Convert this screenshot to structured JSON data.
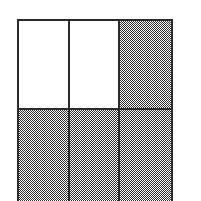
{
  "figure": {
    "kind": "fraction-area-model",
    "columns": 3,
    "rows": 2,
    "total_cells": 6,
    "shaded_cells": 4,
    "unshaded_cells": 2,
    "fraction": "4/6",
    "numerator": "4",
    "denominator": "6",
    "shading_style": "checkerboard-halftone",
    "colors": {
      "outline": "#2b2b2b",
      "divider": "#2b2b2b",
      "shaded_fill": "#808080",
      "shaded_dither_ink": "#2e2e2e",
      "unshaded_fill": "#ffffff",
      "page_background": "#ffffff"
    },
    "cells": [
      {
        "id": "r1c1",
        "row": "1",
        "column": "1",
        "state": "unshaded",
        "label": ""
      },
      {
        "id": "r1c2",
        "row": "1",
        "column": "2",
        "state": "unshaded",
        "label": ""
      },
      {
        "id": "r1c3",
        "row": "1",
        "column": "3",
        "state": "shaded",
        "label": ""
      },
      {
        "id": "r2c1",
        "row": "2",
        "column": "1",
        "state": "shaded",
        "label": ""
      },
      {
        "id": "r2c2",
        "row": "2",
        "column": "2",
        "state": "shaded",
        "label": ""
      },
      {
        "id": "r2c3",
        "row": "2",
        "column": "3",
        "state": "shaded",
        "label": ""
      }
    ]
  }
}
